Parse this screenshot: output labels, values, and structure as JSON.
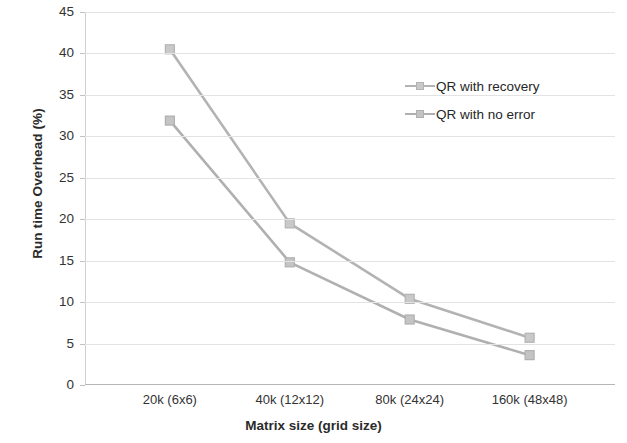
{
  "chart_data": {
    "type": "line",
    "title": "",
    "xlabel": "Matrix size (grid size)",
    "ylabel": "Run time Overhead (%)",
    "categories": [
      "20k (6x6)",
      "40k (12x12)",
      "80k (24x24)",
      "160k (48x48)"
    ],
    "series": [
      {
        "name": "QR with recovery",
        "values": [
          40.5,
          19.5,
          10.4,
          5.7
        ],
        "color": "#b3b3b3",
        "marker_color": "#c9c9c9"
      },
      {
        "name": "QR with no error",
        "values": [
          31.9,
          14.8,
          7.9,
          3.6
        ],
        "color": "#b0b0b0",
        "marker_color": "#c4c4c4"
      }
    ],
    "ylim": [
      0,
      45
    ],
    "ytick_step": 5,
    "yticks": [
      "45",
      "40",
      "35",
      "30",
      "25",
      "20",
      "15",
      "10",
      "5",
      "0"
    ],
    "grid": true,
    "grid_axis": "y",
    "legend_position": "upper-right-inside",
    "grid_color": "#e3e3e3",
    "axis_color": "#b5b5b5",
    "text_color": "#333333"
  }
}
